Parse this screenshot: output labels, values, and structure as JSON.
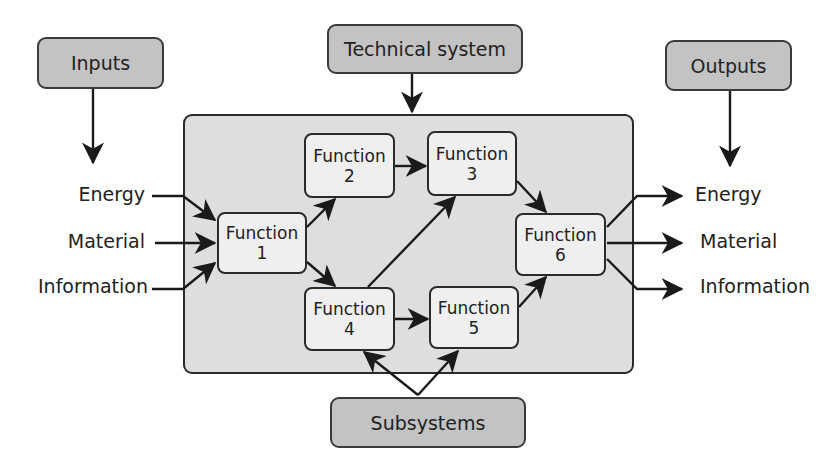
{
  "header_boxes": {
    "inputs": "Inputs",
    "technical_system": "Technical system",
    "outputs": "Outputs",
    "subsystems": "Subsystems"
  },
  "inputs": [
    "Energy",
    "Material",
    "Information"
  ],
  "outputs": [
    "Energy",
    "Material",
    "Information"
  ],
  "functions": [
    {
      "label": "Function",
      "num": "1"
    },
    {
      "label": "Function",
      "num": "2"
    },
    {
      "label": "Function",
      "num": "3"
    },
    {
      "label": "Function",
      "num": "4"
    },
    {
      "label": "Function",
      "num": "5"
    },
    {
      "label": "Function",
      "num": "6"
    }
  ],
  "flows": [
    "Inputs -> Technical system inputs",
    "Technical system -> container",
    "Outputs -> output flows",
    "Function 1 -> Function 2",
    "Function 1 -> Function 4",
    "Function 2 -> Function 3",
    "Function 4 -> Function 3",
    "Function 4 -> Function 5",
    "Function 3 -> Function 6",
    "Function 5 -> Function 6",
    "Subsystems -> Function 4",
    "Subsystems -> Function 5"
  ],
  "colors": {
    "label_box_fill": "#c3c3c3",
    "container_fill": "#dedede",
    "function_fill": "#efefef",
    "stroke": "#2a2a2a"
  }
}
